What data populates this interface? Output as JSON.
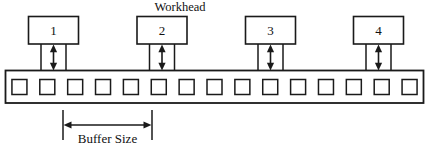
{
  "diagram": {
    "title_label": "Workhead",
    "dimension_label": "Buffer Size",
    "workheads": [
      {
        "number": "1"
      },
      {
        "number": "2"
      },
      {
        "number": "3"
      },
      {
        "number": "4"
      }
    ],
    "conveyor": {
      "slot_count": 15,
      "slots": [
        {
          "index": "1"
        },
        {
          "index": "2"
        },
        {
          "index": "3"
        },
        {
          "index": "4"
        },
        {
          "index": "5"
        },
        {
          "index": "6"
        },
        {
          "index": "7"
        },
        {
          "index": "8"
        },
        {
          "index": "9"
        },
        {
          "index": "10"
        },
        {
          "index": "11"
        },
        {
          "index": "12"
        },
        {
          "index": "13"
        },
        {
          "index": "14"
        },
        {
          "index": "15"
        }
      ]
    },
    "colors": {
      "ink": "#1a1a1a",
      "paper": "#ffffff"
    }
  }
}
